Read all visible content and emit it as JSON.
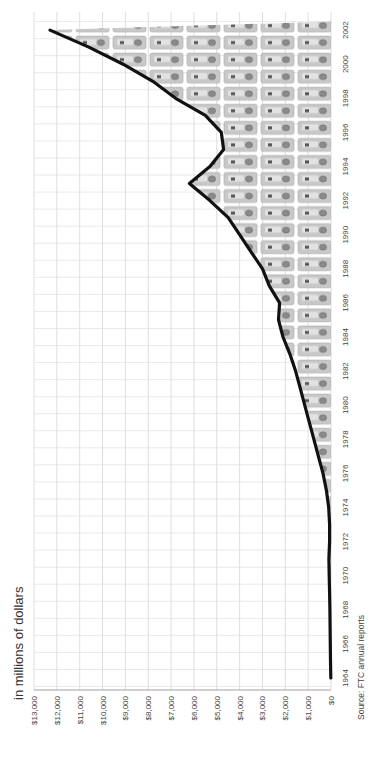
{
  "chart_data": {
    "type": "area",
    "orientation": "rotated-90-ccw",
    "title": "in millions of dollars",
    "source": "Source: FTC annual reports",
    "xlabel": "",
    "ylabel": "in millions of dollars",
    "ylim": [
      0,
      13000
    ],
    "xlim": [
      1964,
      2002
    ],
    "grid": true,
    "legend": null,
    "value_ticks": [
      "$0",
      "$1,000",
      "$2,000",
      "$3,000",
      "$4,000",
      "$5,000",
      "$6,000",
      "$7,000",
      "$8,000",
      "$9,000",
      "$10,000",
      "$11,000",
      "$12,000",
      "$13,000"
    ],
    "year_ticks": [
      "1964",
      "1966",
      "1968",
      "1970",
      "1972",
      "1974",
      "1976",
      "1978",
      "1980",
      "1982",
      "1984",
      "1986",
      "1988",
      "1990",
      "1992",
      "1994",
      "1996",
      "1998",
      "2000",
      "2002"
    ],
    "series": [
      {
        "name": "Value (in millions of dollars)",
        "x": [
          1964,
          1965,
          1966,
          1967,
          1968,
          1969,
          1970,
          1971,
          1972,
          1973,
          1974,
          1975,
          1976,
          1977,
          1978,
          1979,
          1980,
          1981,
          1982,
          1983,
          1984,
          1985,
          1986,
          1987,
          1988,
          1989,
          1990,
          1991,
          1992,
          1993,
          1994,
          1995,
          1996,
          1997,
          1998,
          1999,
          2000,
          2001,
          2002
        ],
        "values": [
          10,
          20,
          30,
          40,
          50,
          60,
          80,
          90,
          60,
          60,
          100,
          200,
          350,
          550,
          750,
          950,
          1150,
          1350,
          1550,
          1800,
          2100,
          2300,
          2250,
          2700,
          3000,
          3500,
          4000,
          4500,
          5300,
          6200,
          5300,
          4700,
          4800,
          5500,
          6800,
          7800,
          9100,
          10600,
          12300
        ]
      }
    ]
  }
}
